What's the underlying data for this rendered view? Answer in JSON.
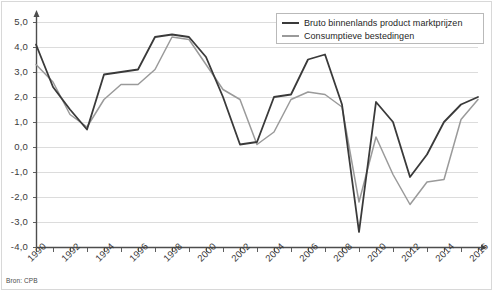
{
  "chart_data": {
    "type": "line",
    "title": "",
    "subtitle": "",
    "xlabel": "",
    "ylabel": "",
    "x": [
      1990,
      1991,
      1992,
      1993,
      1994,
      1995,
      1996,
      1997,
      1998,
      1999,
      2000,
      2001,
      2002,
      2003,
      2004,
      2005,
      2006,
      2007,
      2008,
      2009,
      2010,
      2011,
      2012,
      2013,
      2014,
      2015,
      2016
    ],
    "categories": [
      "1990",
      "1991",
      "1992",
      "1993",
      "1994",
      "1995",
      "1996",
      "1997",
      "1998",
      "1999",
      "2000",
      "2001",
      "2002",
      "2003",
      "2004",
      "2005",
      "2006",
      "2007",
      "2008",
      "2009",
      "2010",
      "2011",
      "2012",
      "2013",
      "2014",
      "2015",
      "2016"
    ],
    "series": [
      {
        "name": "Bruto binnenlands product marktprijzen",
        "color": "#3a3a3a",
        "values": [
          4.1,
          2.4,
          1.5,
          0.7,
          2.9,
          3.0,
          3.1,
          4.4,
          4.5,
          4.4,
          3.6,
          2.0,
          0.1,
          0.2,
          2.0,
          2.1,
          3.5,
          3.7,
          1.7,
          -3.4,
          1.8,
          1.0,
          -1.2,
          -0.3,
          1.0,
          1.7,
          2.0
        ],
        "legend_label": "Bruto binnenlands product marktprijzen"
      },
      {
        "name": "Consumptieve bestedingen",
        "color": "#9a9a9a",
        "values": [
          3.3,
          2.6,
          1.3,
          0.8,
          1.9,
          2.5,
          2.5,
          3.1,
          4.4,
          4.3,
          3.3,
          2.3,
          1.9,
          0.1,
          0.6,
          1.9,
          2.2,
          2.1,
          1.6,
          -2.2,
          0.4,
          -1.1,
          -2.3,
          -1.4,
          -1.3,
          1.1,
          1.9
        ],
        "legend_label": "Consumptieve bestedingen"
      }
    ],
    "ylim": [
      -4.0,
      5.0
    ],
    "ytick_values": [
      5.0,
      4.0,
      3.0,
      2.0,
      1.0,
      0.0,
      -1.0,
      -2.0,
      -3.0,
      -4.0
    ],
    "ytick_labels": [
      "5,0",
      "4,0",
      "3,0",
      "2,0",
      "1,0",
      "0,0",
      "-1,0",
      "-2,0",
      "-3,0",
      "-4,0"
    ],
    "xlim": [
      1990,
      2016
    ],
    "xtick_labels": [
      "1990",
      "1992",
      "1994",
      "1996",
      "1998",
      "2000",
      "2002",
      "2004",
      "2006",
      "2008",
      "2010",
      "2012",
      "2014",
      "2016"
    ],
    "xtick_values": [
      1990,
      1992,
      1994,
      1996,
      1998,
      2000,
      2002,
      2004,
      2006,
      2008,
      2010,
      2012,
      2014,
      2016
    ],
    "grid": true,
    "grid_color": "#dcdcdc",
    "legend_position": "top-right",
    "legend_entries": [
      "Bruto binnenlands product marktprijzen",
      "Consumptieve bestedingen"
    ]
  },
  "legend": {
    "items": [
      {
        "label": "Bruto binnenlands product marktprijzen",
        "color": "#3a3a3a"
      },
      {
        "label": "Consumptieve bestedingen",
        "color": "#9a9a9a"
      }
    ]
  },
  "footer": {
    "source": "Bron: CPB"
  },
  "axis": {
    "y_labels": [
      "5,0",
      "4,0",
      "3,0",
      "2,0",
      "1,0",
      "0,0",
      "-1,0",
      "-2,0",
      "-3,0",
      "-4,0"
    ],
    "x_labels": [
      "1990",
      "1992",
      "1994",
      "1996",
      "1998",
      "2000",
      "2002",
      "2004",
      "2006",
      "2008",
      "2010",
      "2012",
      "2014",
      "2016"
    ]
  },
  "colors": {
    "gdp_line": "#3a3a3a",
    "consumption_line": "#9a9a9a",
    "grid": "#dcdcdc",
    "axis": "#4d4d4d",
    "frame": "#d8d8d8"
  }
}
